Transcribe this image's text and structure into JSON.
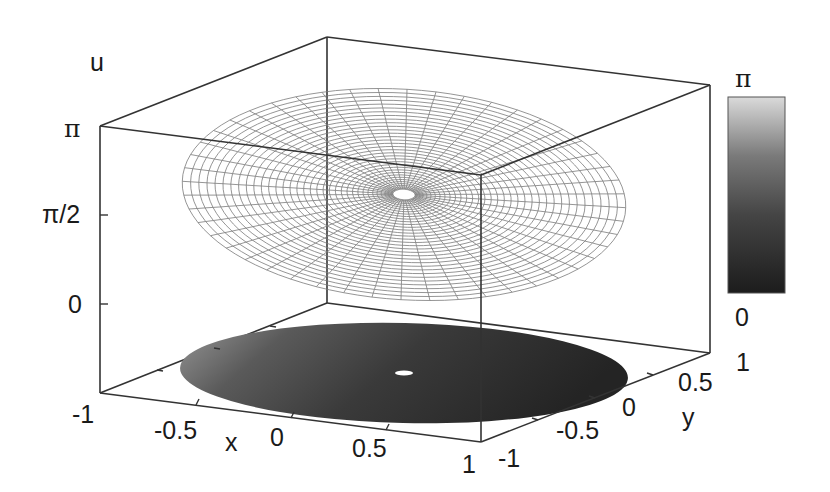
{
  "chart_data": {
    "type": "surface3d",
    "title": "",
    "xlabel": "x",
    "ylabel": "y",
    "zlabel": "u",
    "xlim": [
      -1,
      1
    ],
    "ylim": [
      -1,
      1
    ],
    "zlim": [
      0,
      3.14159
    ],
    "x_ticks": [
      "-1",
      "-0.5",
      "0",
      "0.5",
      "1"
    ],
    "y_ticks": [
      "-1",
      "-0.5",
      "0",
      "0.5",
      "1"
    ],
    "z_ticks": [
      "0",
      "π/2",
      "π"
    ],
    "colorbar": {
      "min_label": "0",
      "max_label": "π",
      "range": [
        0,
        3.14159
      ],
      "colors": [
        "#1e1e1e",
        "#555555",
        "#d8d8d8"
      ]
    },
    "surface": {
      "domain": "annulus 0.05 ≤ r ≤ 1",
      "mesh": "polar grid (radial spokes × concentric rings)",
      "u_at_center": 1.5708,
      "u_range": [
        0.1,
        3.0
      ],
      "line_color": "#7a7a7a"
    },
    "grid": false,
    "legend": "none"
  },
  "labels": {
    "z_axis_title": "u",
    "z_tick_pi": "π",
    "z_tick_half_pi": "π/2",
    "z_tick_zero": "0",
    "x_axis_title": "x",
    "x_tick_m1": "-1",
    "x_tick_m05": "-0.5",
    "x_tick_0": "0",
    "x_tick_05": "0.5",
    "x_tick_1": "1",
    "y_axis_title": "y",
    "y_tick_m1": "-1",
    "y_tick_m05": "-0.5",
    "y_tick_0": "0",
    "y_tick_05": "0.5",
    "y_tick_1": "1",
    "cb_max": "π",
    "cb_min": "0"
  }
}
